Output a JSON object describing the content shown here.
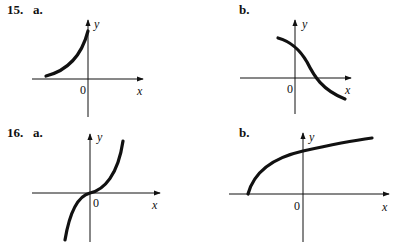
{
  "problems": [
    {
      "number": "15.",
      "parts": [
        {
          "label": "a.",
          "x_label": "x",
          "y_label": "y",
          "origin_label": "0",
          "curve": "increasing concave up, exponential-like, ending at y-axis"
        },
        {
          "label": "b.",
          "x_label": "x",
          "y_label": "y",
          "origin_label": "0",
          "curve": "decreasing, crosses y-axis above origin and x-axis at positive x"
        }
      ]
    },
    {
      "number": "16.",
      "parts": [
        {
          "label": "a.",
          "x_label": "x",
          "y_label": "y",
          "origin_label": "0",
          "curve": "increasing cubic-like through origin"
        },
        {
          "label": "b.",
          "x_label": "x",
          "y_label": "y",
          "origin_label": "0",
          "curve": "square-root-like starting on negative x-axis"
        }
      ]
    }
  ],
  "colors": {
    "ink": "#111111",
    "background": "#ffffff"
  }
}
